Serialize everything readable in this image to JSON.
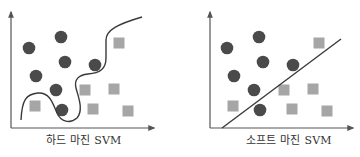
{
  "colors": {
    "circle": "#4a4a4a",
    "square": "#a6a6a6",
    "axis": "#555555",
    "boundary": "#3a3a3a",
    "caption": "#333333"
  },
  "panels": [
    {
      "id": "hard-margin",
      "caption": "하드 마진 SVM",
      "caption_x": 46,
      "axes": {
        "origin": [
          11,
          128
        ],
        "y_top": 12,
        "x_right": 154
      },
      "circles": [
        [
          29,
          48
        ],
        [
          61,
          37
        ],
        [
          65,
          62
        ],
        [
          95,
          65
        ],
        [
          36,
          76
        ],
        [
          56,
          90
        ],
        [
          62,
          110
        ]
      ],
      "squares": [
        [
          119,
          43
        ],
        [
          85,
          90
        ],
        [
          114,
          89
        ],
        [
          93,
          109
        ],
        [
          128,
          111
        ],
        [
          35,
          106
        ]
      ],
      "boundary": {
        "type": "curve",
        "path": "M21,120 C22,100 26,94 38,93 C50,92 53,104 57,113 C61,122 70,124 77,118 C84,110 78,96 76,88 C74,80 78,75 88,74 C100,73 106,69 106,58 L106,40 C106,30 118,24 142,17"
      }
    },
    {
      "id": "soft-margin",
      "caption": "소프트 마진 SVM",
      "caption_x": 246,
      "axes": {
        "origin": [
          210,
          128
        ],
        "y_top": 12,
        "x_right": 353
      },
      "circles": [
        [
          227,
          48
        ],
        [
          259,
          37
        ],
        [
          263,
          62
        ],
        [
          293,
          65
        ],
        [
          234,
          76
        ],
        [
          254,
          90
        ],
        [
          260,
          110
        ]
      ],
      "squares": [
        [
          319,
          43
        ],
        [
          284,
          90
        ],
        [
          313,
          89
        ],
        [
          292,
          109
        ],
        [
          327,
          111
        ],
        [
          233,
          106
        ]
      ],
      "boundary": {
        "type": "line",
        "from": [
          222,
          128
        ],
        "to": [
          341,
          39
        ]
      }
    }
  ]
}
